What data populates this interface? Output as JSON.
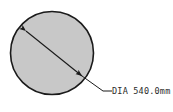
{
  "drawing": {
    "title": "Circular section diameter dimension drawing",
    "background_color": "#ffffff",
    "shape": {
      "name": "circle",
      "fill_color": "#c8c8c8",
      "stroke_color": "#1a1a1a",
      "center_x": 52,
      "center_y": 53,
      "radius": 42
    },
    "dimension_line": {
      "style": "double-arrow",
      "stroke_color": "#1a1a1a",
      "x1": 26,
      "y1": 31,
      "x2": 82,
      "y2": 76
    },
    "leader_line": {
      "stroke_color": "#1a1a1a",
      "elbow_x": 103,
      "elbow_y": 91,
      "end_x": 112,
      "end_y": 91
    },
    "label": {
      "text": "DIA 540.0mm",
      "prefix": "DIA",
      "value": "540.0",
      "unit": "mm",
      "x": 105,
      "y": 94,
      "color": "#2b2b2b"
    }
  }
}
